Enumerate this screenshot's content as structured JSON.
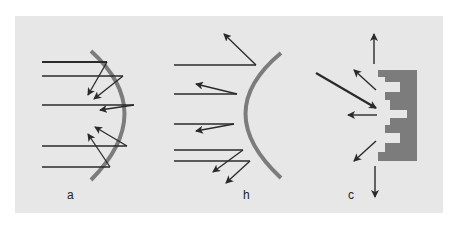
{
  "figure": {
    "background": "#e7e7e7",
    "line_color": "#2a2a2a",
    "surface_color": "#7c7c7c",
    "panels": [
      {
        "id": "a",
        "label": "a",
        "description": "Concave surface: parallel rays reflected and converged toward focus",
        "surface": "concave-arc",
        "incident_rays_y": [
          62,
          76,
          105,
          146,
          167
        ]
      },
      {
        "id": "b",
        "label": "h",
        "description": "Convex surface: parallel rays reflected and diverged",
        "surface": "convex-arc",
        "incident_rays_y": [
          65,
          94,
          124,
          150,
          161
        ]
      },
      {
        "id": "c",
        "label": "c",
        "description": "Irregular stepped surface: incident ray scattered/diffused in many directions",
        "surface": "stepped-block",
        "scattered_arrows": 5
      }
    ]
  }
}
